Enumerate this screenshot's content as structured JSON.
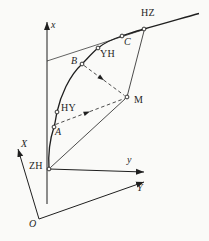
{
  "figure": {
    "kind": "transition-curve-layout-diagram",
    "background_color": "#fafaf8",
    "ink_color": "#1f1f1f",
    "axis_labels": {
      "local_x": "x",
      "local_y": "y",
      "global_x": "X",
      "global_y": "Y",
      "global_origin": "O"
    },
    "point_labels": {
      "zh": "ZH",
      "a": "A",
      "hy": "HY",
      "b": "B",
      "yh": "YH",
      "c": "C",
      "hz": "HZ",
      "m": "M"
    },
    "curve_point_order": [
      "ZH",
      "A",
      "HY",
      "B",
      "YH",
      "C",
      "HZ"
    ],
    "solid_connections": [
      [
        "ZH",
        "M"
      ],
      [
        "M",
        "HZ"
      ]
    ],
    "dashed_arrow_rays": [
      [
        "A",
        "M"
      ],
      [
        "B",
        "M"
      ]
    ],
    "tangent_line": {
      "from": "local-x-axis",
      "through": "C",
      "to": "HZ"
    }
  }
}
